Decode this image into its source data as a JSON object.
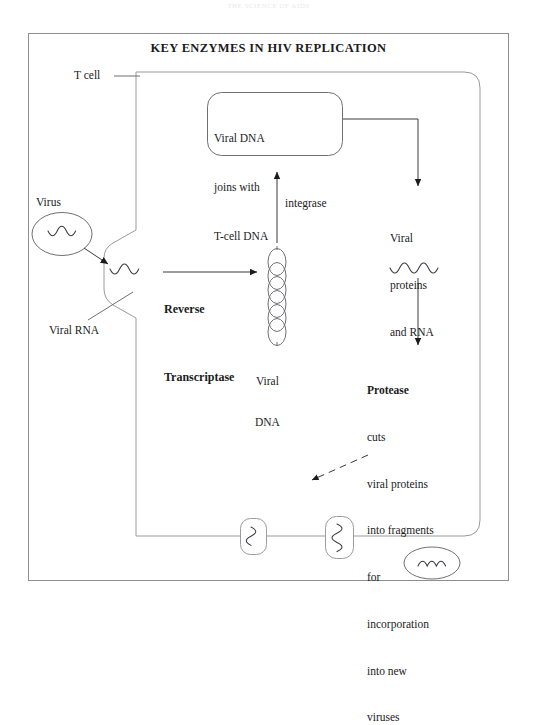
{
  "page": {
    "faint_header": "THE SCIENCE OF AIDS",
    "background_color": "#ffffff",
    "ink_color": "#1b1b1b"
  },
  "figure": {
    "title": "KEY ENZYMES IN HIV REPLICATION",
    "labels": {
      "t_cell": "T cell",
      "virus": "Virus",
      "viral_rna": "Viral RNA",
      "integrase": "integrase",
      "viral_dna_line1": "Viral",
      "viral_dna_line2": "DNA"
    },
    "integration_box": {
      "line1": "Viral DNA",
      "line2": "joins with",
      "line3": "T-cell DNA"
    },
    "reverse_transcriptase": {
      "line1": "Reverse",
      "line2": "Transcriptase"
    },
    "viral_products": {
      "line1": "Viral",
      "line2": "proteins",
      "line3": "and RNA"
    },
    "protease": {
      "head": "Protease",
      "line1": "cuts",
      "line2": "viral proteins",
      "line3": "into fragments",
      "line4": "for",
      "line5": "incorporation",
      "line6": "into new",
      "line7": "viruses"
    }
  }
}
